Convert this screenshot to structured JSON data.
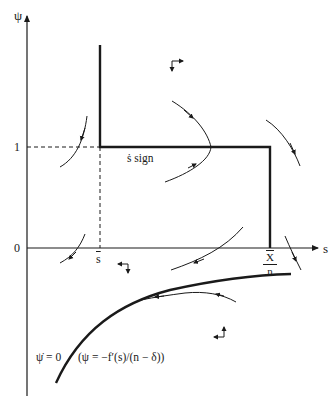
{
  "diagram": {
    "axes": {
      "y_label": "ψ",
      "x_label": "s",
      "y_ticks": [
        "1",
        "0"
      ],
      "x_ticks": {
        "s_bar": "s",
        "x_over_n": {
          "numerator": "X",
          "denominator": "n"
        }
      }
    },
    "annotations": {
      "s_dot_sign": "ṡ sign",
      "psi_dot_zero": "ψ̇ = 0",
      "psi_dot_zero_formula": "(ψ = −f′(s)/(n − δ))"
    },
    "colors": {
      "ink": "#1a1a1a",
      "background": "#ffffff"
    }
  }
}
